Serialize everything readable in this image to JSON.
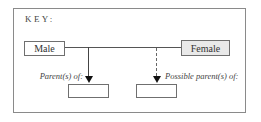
{
  "key": {
    "title": "KEY:"
  },
  "nodes": {
    "male": {
      "label": "Male",
      "fill": "#ffffff"
    },
    "female": {
      "label": "Female",
      "fill": "#e9e9e9"
    }
  },
  "relations": [
    {
      "label": "Parent(s) of:",
      "line_style": "solid"
    },
    {
      "label": "Possible parent(s) of:",
      "line_style": "dashed"
    }
  ],
  "colors": {
    "border": "#6f6f6f",
    "frame": "#8a8a8a",
    "arrow": "#111111"
  }
}
